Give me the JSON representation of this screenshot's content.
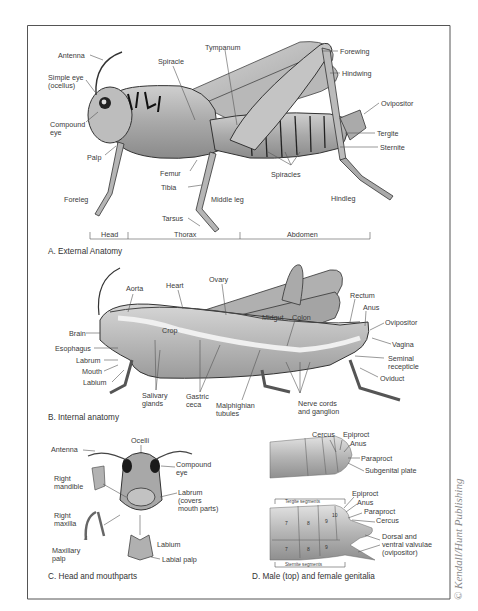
{
  "figure": {
    "credit": "© Kendall/Hunt Publishing",
    "panels": {
      "A": {
        "caption": "A. External Anatomy",
        "labels": {
          "antenna": "Antenna",
          "simple_eye_1": "Simple eye",
          "simple_eye_2": "(ocellus)",
          "compound_eye_1": "Compound",
          "compound_eye_2": "eye",
          "palp": "Palp",
          "foreleg": "Foreleg",
          "spiracle": "Spiracle",
          "tympanum": "Tympanum",
          "forewing": "Forewing",
          "hindwing": "Hindwing",
          "ovipositor": "Ovipositor",
          "tergite": "Tergite",
          "sternite": "Sternite",
          "spiracles": "Spiracles",
          "femur": "Femur",
          "tibia": "Tibia",
          "middle_leg": "Middle leg",
          "hindleg": "Hindleg",
          "tarsus": "Tarsus"
        },
        "regions": [
          "Head",
          "Thorax",
          "Abdomen"
        ]
      },
      "B": {
        "caption": "B. Internal anatomy",
        "labels": {
          "aorta": "Aorta",
          "heart": "Heart",
          "ovary": "Ovary",
          "brain": "Brain",
          "esophagus": "Esophagus",
          "labrum": "Labrum",
          "mouth": "Mouth",
          "labium": "Labium",
          "crop": "Crop",
          "midgut": "Midgut",
          "colon": "Colon",
          "rectum": "Rectum",
          "anus": "Anus",
          "ovipositor": "Ovipositor",
          "vagina": "Vagina",
          "seminal_1": "Seminal",
          "seminal_2": "recepticle",
          "oviduct": "Oviduct",
          "salivary_1": "Salivary",
          "salivary_2": "glands",
          "gastric_1": "Gastric",
          "gastric_2": "ceca",
          "malpighian_1": "Malphighian",
          "malpighian_2": "tubules",
          "nerve_1": "Nerve cords",
          "nerve_2": "and ganglion"
        }
      },
      "C": {
        "caption": "C. Head and mouthparts",
        "labels": {
          "antenna": "Antenna",
          "ocelli": "Ocelli",
          "compound_eye_1": "Compound",
          "compound_eye_2": "eye",
          "right_mandible_1": "Right",
          "right_mandible_2": "mandible",
          "labrum_1": "Labrum",
          "labrum_2": "(covers",
          "labrum_3": "mouth parts)",
          "right_maxilla_1": "Right",
          "right_maxilla_2": "maxilla",
          "maxillary_palp_1": "Maxillary",
          "maxillary_palp_2": "palp",
          "labium": "Labium",
          "labial_palp": "Labial palp"
        }
      },
      "D": {
        "caption": "D. Male (top) and female genitalia",
        "male_labels": {
          "cercus": "Cercus",
          "epiproct": "Epiproct",
          "anus": "Anus",
          "paraproct": "Paraproct",
          "subgenital_plate": "Subgenital plate"
        },
        "female_labels": {
          "epiproct": "Epiproct",
          "anus": "Anus",
          "paraproct": "Paraproct",
          "cercus": "Cercus",
          "valvulae_1": "Dorsal and",
          "valvulae_2": "ventral valvulae",
          "valvulae_3": "(ovipositor)"
        },
        "tergite_segments": "Tergite segments",
        "sternite_segments": "Sternite segments",
        "tergite_numbers": [
          "7",
          "8",
          "9",
          "10"
        ],
        "sternite_numbers": [
          "7",
          "8",
          "9"
        ]
      }
    }
  }
}
